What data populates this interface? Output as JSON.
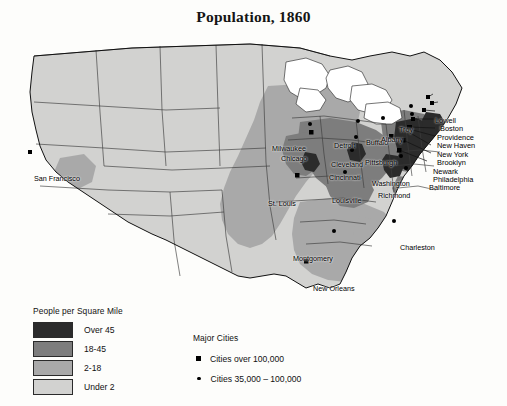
{
  "title": "Population, 1860",
  "legend_density": {
    "heading": "People per Square Mile",
    "classes": [
      {
        "label": "Over 45",
        "color": "#2b2b2b"
      },
      {
        "label": "18-45",
        "color": "#7d7d7d"
      },
      {
        "label": "2-18",
        "color": "#a9a9a9"
      },
      {
        "label": "Under 2",
        "color": "#d2d2d0"
      }
    ]
  },
  "legend_cities": {
    "heading": "Major Cities",
    "entries": [
      {
        "marker": "square-marker",
        "label": "Cities over 100,000"
      },
      {
        "marker": "dot-marker",
        "label": "Cities 35,000 – 100,000"
      }
    ]
  },
  "map": {
    "water_color": "#ffffff",
    "border_color": "#1c1c1c",
    "background_color": "#fdfdfb",
    "cities": [
      {
        "name": "San Francisco",
        "marker": "square-marker",
        "x": 30,
        "y": 152,
        "label_x": 34,
        "label_y": 148
      },
      {
        "name": "Milwaukee",
        "marker": "dot-marker",
        "x": 310,
        "y": 124,
        "label_x": 272,
        "label_y": 118
      },
      {
        "name": "Chicago",
        "marker": "square-marker",
        "x": 311,
        "y": 132,
        "label_x": 281,
        "label_y": 128
      },
      {
        "name": "Detroit",
        "marker": "dot-marker",
        "x": 358,
        "y": 121,
        "label_x": 334,
        "label_y": 115
      },
      {
        "name": "Buffalo",
        "marker": "dot-marker",
        "x": 383,
        "y": 118,
        "label_x": 365,
        "label_y": 112
      },
      {
        "name": "Cleveland",
        "marker": "dot-marker",
        "x": 356,
        "y": 137,
        "label_x": 331,
        "label_y": 134
      },
      {
        "name": "Cincinnati",
        "marker": "dot-marker",
        "x": 352,
        "y": 150,
        "label_x": 329,
        "label_y": 147
      },
      {
        "name": "Pittsburgh",
        "marker": "dot-marker",
        "x": 391,
        "y": 136,
        "label_x": 367,
        "label_y": 132
      },
      {
        "name": "Washington",
        "marker": "dot-marker",
        "x": 401,
        "y": 156,
        "label_x": 372,
        "label_y": 153
      },
      {
        "name": "Richmond",
        "marker": "dot-marker",
        "x": 406,
        "y": 168,
        "label_x": 378,
        "label_y": 165
      },
      {
        "name": "St. Louis",
        "marker": "square-marker",
        "x": 297,
        "y": 175,
        "label_x": 270,
        "label_y": 176
      },
      {
        "name": "Louisville",
        "marker": "dot-marker",
        "x": 345,
        "y": 172,
        "label_x": 332,
        "label_y": 170
      },
      {
        "name": "Montgomery",
        "marker": "dot-marker",
        "x": 334,
        "y": 231,
        "label_x": 295,
        "label_y": 229
      },
      {
        "name": "New Orleans",
        "marker": "square-marker",
        "x": 306,
        "y": 261,
        "label_x": 313,
        "label_y": 260
      },
      {
        "name": "Charleston",
        "marker": "dot-marker",
        "x": 394,
        "y": 221,
        "label_x": 400,
        "label_y": 218
      },
      {
        "name": "Troy",
        "marker": "dot-marker",
        "x": 411,
        "y": 106,
        "label_x": 398,
        "label_y": 100
      },
      {
        "name": "Albany",
        "marker": "dot-marker",
        "x": 412,
        "y": 114,
        "label_x": 383,
        "label_y": 110
      }
    ],
    "northeast_labels": [
      {
        "name": "Lowell",
        "label_x": 434,
        "label_y": 94,
        "marker_x": 428,
        "marker_y": 97
      },
      {
        "name": "Boston",
        "label_x": 440,
        "label_y": 102,
        "marker_x": 432,
        "marker_y": 103
      },
      {
        "name": "Providence",
        "label_x": 437,
        "label_y": 111,
        "marker_x": 424,
        "marker_y": 110
      },
      {
        "name": "New Haven",
        "label_x": 437,
        "label_y": 119,
        "marker_x": 413,
        "marker_y": 119
      },
      {
        "name": "New York",
        "label_x": 437,
        "label_y": 128,
        "marker_x": 409,
        "marker_y": 127
      },
      {
        "name": "Brooklyn",
        "label_x": 437,
        "label_y": 136,
        "marker_x": 409,
        "marker_y": 129
      },
      {
        "name": "Newark",
        "label_x": 433,
        "label_y": 145,
        "marker_x": 405,
        "marker_y": 130
      },
      {
        "name": "Philadelphia",
        "label_x": 433,
        "label_y": 153,
        "marker_x": 403,
        "marker_y": 140
      },
      {
        "name": "Baltimore",
        "label_x": 429,
        "label_y": 161,
        "marker_x": 399,
        "marker_y": 150
      }
    ]
  }
}
